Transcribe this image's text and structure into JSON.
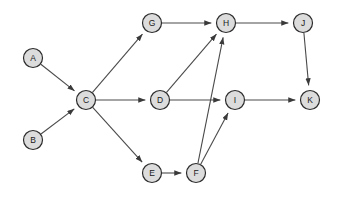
{
  "diagram": {
    "type": "directed-graph",
    "background_color": "#ffffff",
    "node_fill_color": "#dcdcdc",
    "node_stroke_color": "#2b2b2b",
    "edge_color": "#4a4a4a",
    "node_radius": 9.5,
    "width": 338,
    "height": 198,
    "nodes": [
      {
        "id": "A",
        "label": "A",
        "x": 33,
        "y": 58
      },
      {
        "id": "B",
        "label": "B",
        "x": 33,
        "y": 140
      },
      {
        "id": "C",
        "label": "C",
        "x": 86,
        "y": 100
      },
      {
        "id": "D",
        "label": "D",
        "x": 160,
        "y": 100
      },
      {
        "id": "E",
        "label": "E",
        "x": 152,
        "y": 173
      },
      {
        "id": "F",
        "label": "F",
        "x": 196,
        "y": 173
      },
      {
        "id": "G",
        "label": "G",
        "x": 152,
        "y": 23
      },
      {
        "id": "H",
        "label": "H",
        "x": 226,
        "y": 23
      },
      {
        "id": "I",
        "label": "I",
        "x": 235,
        "y": 100
      },
      {
        "id": "J",
        "label": "J",
        "x": 303,
        "y": 23
      },
      {
        "id": "K",
        "label": "K",
        "x": 310,
        "y": 100
      }
    ],
    "edges": [
      {
        "from": "A",
        "to": "C",
        "directed": true
      },
      {
        "from": "B",
        "to": "C",
        "directed": true
      },
      {
        "from": "C",
        "to": "G",
        "directed": true
      },
      {
        "from": "C",
        "to": "D",
        "directed": true
      },
      {
        "from": "C",
        "to": "E",
        "directed": true
      },
      {
        "from": "G",
        "to": "H",
        "directed": true
      },
      {
        "from": "D",
        "to": "H",
        "directed": true
      },
      {
        "from": "D",
        "to": "I",
        "directed": true
      },
      {
        "from": "E",
        "to": "F",
        "directed": true
      },
      {
        "from": "F",
        "to": "H",
        "directed": true
      },
      {
        "from": "F",
        "to": "I",
        "directed": true
      },
      {
        "from": "H",
        "to": "J",
        "directed": true
      },
      {
        "from": "I",
        "to": "K",
        "directed": true
      },
      {
        "from": "J",
        "to": "K",
        "directed": true
      }
    ]
  }
}
